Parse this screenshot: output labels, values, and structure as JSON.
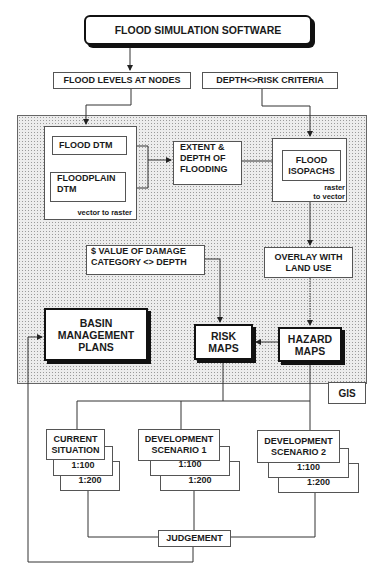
{
  "title": "FLOOD SIMULATION SOFTWARE",
  "inputs": {
    "flood_levels": "FLOOD LEVELS AT NODES",
    "depth_risk": "DEPTH<>RISK CRITERIA"
  },
  "gis": {
    "label": "GIS",
    "vector_group": {
      "flood_dtm": "FLOOD DTM",
      "floodplain_dtm_1": "FLOODPLAIN",
      "floodplain_dtm_2": "DTM",
      "note": "vector to raster"
    },
    "extent": [
      "EXTENT &",
      "DEPTH OF",
      "FLOODING"
    ],
    "raster_group": {
      "isopachs_1": "FLOOD",
      "isopachs_2": "ISOPACHS",
      "note_1": "raster",
      "note_2": "to vector"
    },
    "damage": [
      "$ VALUE OF DAMAGE",
      "CATEGORY <> DEPTH"
    ],
    "overlay": [
      "OVERLAY WITH",
      "LAND USE"
    ],
    "basin": [
      "BASIN",
      "MANAGEMENT",
      "PLANS"
    ],
    "risk": [
      "RISK",
      "MAPS"
    ],
    "hazard": [
      "HAZARD",
      "MAPS"
    ]
  },
  "scenarios": [
    {
      "name_1": "CURRENT",
      "name_2": "SITUATION",
      "r1": "1:100",
      "r2": "1:200"
    },
    {
      "name_1": "DEVELOPMENT",
      "name_2": "SCENARIO 1",
      "r1": "1:100",
      "r2": "1:200"
    },
    {
      "name_1": "DEVELOPMENT",
      "name_2": "SCENARIO 2",
      "r1": "1:100",
      "r2": "1:200"
    }
  ],
  "judgement": "JUDGEMENT"
}
